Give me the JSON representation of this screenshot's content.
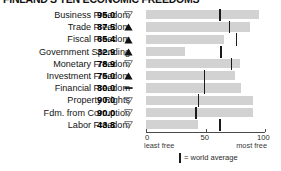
{
  "title": "FINLAND'S TEN ECONOMIC FREEDOMS",
  "axis": {
    "min": 0,
    "max": 100,
    "ticks": [
      0,
      50,
      100
    ],
    "tick_labels": [
      "0",
      "50",
      "100"
    ],
    "left_caption": "least free",
    "right_caption": "most free"
  },
  "legend": {
    "label": "= world average",
    "swatch": "world-average-tick"
  },
  "indicators": {
    "up": "▲",
    "down": "▽",
    "flat": "—"
  },
  "colors": {
    "bar": "#d2d2d2",
    "average_tick": "#1b1b1b",
    "axis": "#4a4a4a",
    "text": "#141414"
  },
  "chart_data": {
    "type": "bar",
    "orientation": "horizontal",
    "title": "FINLAND'S TEN ECONOMIC FREEDOMS",
    "xlabel": "",
    "ylabel": "",
    "xlim": [
      0,
      100
    ],
    "grid": false,
    "legend_position": "bottom",
    "categories": [
      "Business Freedom",
      "Trade Freedom",
      "Fiscal Freedom",
      "Government Spending",
      "Monetary Freedom",
      "Investment Freedom",
      "Financial Freedom",
      "Property Rights",
      "Fdm. from Corruption",
      "Labor Freedom"
    ],
    "values": [
      95.0,
      87.5,
      65.4,
      32.9,
      78.9,
      75.0,
      80.0,
      90.0,
      90.0,
      43.8
    ],
    "value_labels": [
      "95.0",
      "87.5",
      "65.4",
      "32.9",
      "78.9",
      "75.0",
      "80.0",
      "90.0",
      "90.0",
      "43.8"
    ],
    "trends": [
      "down",
      "up",
      "up",
      "up",
      "down",
      "up",
      "flat",
      "down",
      "down",
      "down"
    ],
    "world_average": [
      62,
      70,
      76,
      63,
      72,
      49,
      49,
      44,
      42,
      62
    ],
    "series": [
      {
        "name": "Finland score",
        "values": [
          95.0,
          87.5,
          65.4,
          32.9,
          78.9,
          75.0,
          80.0,
          90.0,
          90.0,
          43.8
        ]
      },
      {
        "name": "world average",
        "values": [
          62,
          70,
          76,
          63,
          72,
          49,
          49,
          44,
          42,
          62
        ]
      }
    ]
  },
  "rows": [
    {
      "label": "Business Freedom",
      "value": "95.0",
      "trend": "down",
      "score": 95.0,
      "avg": 62
    },
    {
      "label": "Trade Freedom",
      "value": "87.5",
      "trend": "up",
      "score": 87.5,
      "avg": 70
    },
    {
      "label": "Fiscal Freedom",
      "value": "65.4",
      "trend": "up",
      "score": 65.4,
      "avg": 76
    },
    {
      "label": "Government Spending",
      "value": "32.9",
      "trend": "up",
      "score": 32.9,
      "avg": 63
    },
    {
      "label": "Monetary Freedom",
      "value": "78.9",
      "trend": "down",
      "score": 78.9,
      "avg": 72
    },
    {
      "label": "Investment Freedom",
      "value": "75.0",
      "trend": "up",
      "score": 75.0,
      "avg": 49
    },
    {
      "label": "Financial Freedom",
      "value": "80.0",
      "trend": "flat",
      "score": 80.0,
      "avg": 49
    },
    {
      "label": "Property Rights",
      "value": "90.0",
      "trend": "down",
      "score": 90.0,
      "avg": 44
    },
    {
      "label": "Fdm. from Corruption",
      "value": "90.0",
      "trend": "down",
      "score": 90.0,
      "avg": 42
    },
    {
      "label": "Labor Freedom",
      "value": "43.8",
      "trend": "down",
      "score": 43.8,
      "avg": 62
    }
  ]
}
